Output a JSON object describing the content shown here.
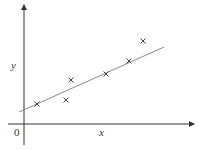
{
  "chart_data": {
    "type": "scatter",
    "title": "",
    "xlabel": "x",
    "ylabel": "y",
    "origin_label": "0",
    "grid": false,
    "legend": null,
    "points_px": [
      [
        37,
        104
      ],
      [
        66,
        100
      ],
      [
        71,
        80
      ],
      [
        106,
        74
      ],
      [
        129,
        61
      ],
      [
        143,
        41
      ]
    ],
    "points": [
      {
        "x": 1.0,
        "y": 1.6
      },
      {
        "x": 3.3,
        "y": 1.9
      },
      {
        "x": 3.7,
        "y": 3.5
      },
      {
        "x": 6.5,
        "y": 4.0
      },
      {
        "x": 8.3,
        "y": 5.0
      },
      {
        "x": 9.5,
        "y": 6.6
      }
    ],
    "fit_line": {
      "type": "linear",
      "from_px": [
        19,
        112
      ],
      "to_px": [
        164,
        47
      ]
    },
    "marker": "x",
    "colors": {
      "axis": "#333333",
      "marker": "#444444",
      "line": "#888888"
    }
  }
}
